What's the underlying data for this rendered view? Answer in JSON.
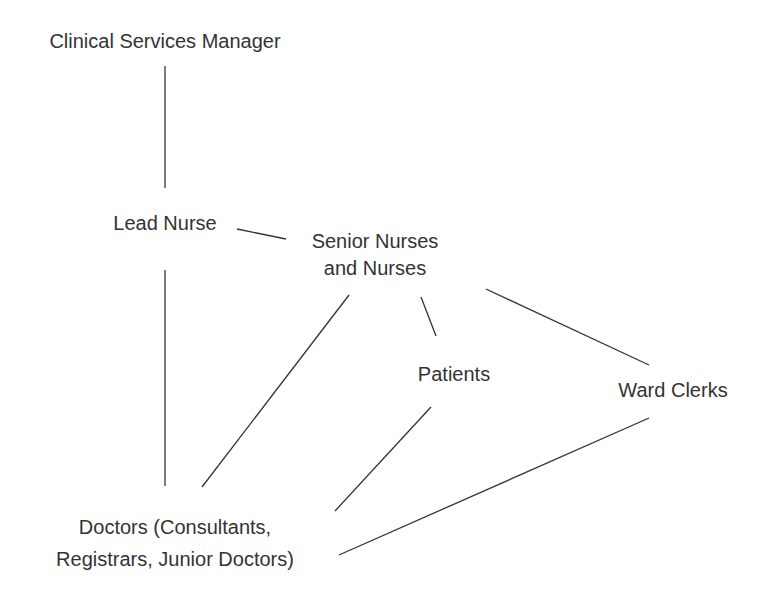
{
  "diagram": {
    "type": "organizational-relationship",
    "colors": {
      "text": "#333333",
      "line": "#333333",
      "background": "#ffffff"
    },
    "nodes": [
      {
        "id": "csm",
        "lines": [
          "Clinical Services Manager"
        ]
      },
      {
        "id": "lead",
        "lines": [
          "Lead Nurse"
        ]
      },
      {
        "id": "senior",
        "lines": [
          "Senior Nurses",
          "and Nurses"
        ]
      },
      {
        "id": "patients",
        "lines": [
          "Patients"
        ]
      },
      {
        "id": "clerks",
        "lines": [
          "Ward Clerks"
        ]
      },
      {
        "id": "doctors",
        "lines": [
          "Doctors (Consultants,",
          "Registrars, Junior Doctors)"
        ]
      }
    ],
    "edges": [
      {
        "from": "csm",
        "to": "lead"
      },
      {
        "from": "lead",
        "to": "senior"
      },
      {
        "from": "lead",
        "to": "doctors"
      },
      {
        "from": "senior",
        "to": "doctors"
      },
      {
        "from": "senior",
        "to": "patients"
      },
      {
        "from": "senior",
        "to": "clerks"
      },
      {
        "from": "patients",
        "to": "doctors"
      },
      {
        "from": "clerks",
        "to": "doctors"
      }
    ]
  }
}
